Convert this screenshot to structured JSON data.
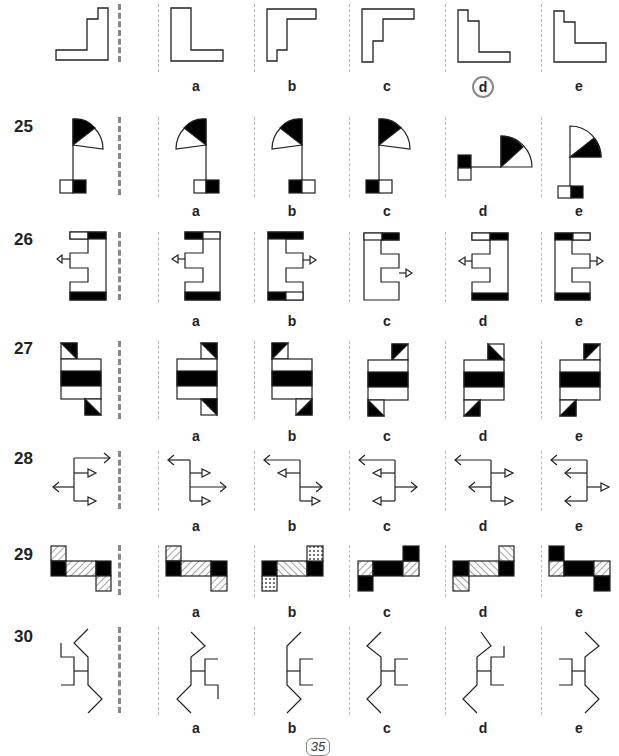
{
  "page": {
    "page_number": "35",
    "option_labels": [
      "a",
      "b",
      "c",
      "d",
      "e"
    ]
  },
  "questions": [
    {
      "number": "",
      "description": "Stepped L-shape; option d is circled as the answer",
      "circled_answer": "d"
    },
    {
      "number": "25",
      "description": "Flag with quarter-circle split black/white, pole ending in two-square base"
    },
    {
      "number": "26",
      "description": "E-shaped bracket with black/white bars and outline arrow"
    },
    {
      "number": "27",
      "description": "Box with black middle stripe and diagonal-split corner squares"
    },
    {
      "number": "28",
      "description": "Branching tree of open and triangular arrows"
    },
    {
      "number": "29",
      "description": "Z-arrangement of black, hatched and cross-hatched squares"
    },
    {
      "number": "30",
      "description": "Zig-zag line figure with H-shaped center"
    }
  ],
  "colors": {
    "ink": "#222222",
    "divider_thick": "#888888",
    "divider_thin": "#bbbbbb",
    "circle": "#888888"
  }
}
